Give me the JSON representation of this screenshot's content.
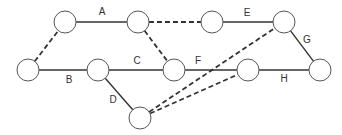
{
  "diagram": {
    "type": "network",
    "nodes": [
      {
        "id": "n1",
        "x": 28,
        "y": 70
      },
      {
        "id": "n2",
        "x": 65,
        "y": 22
      },
      {
        "id": "n3",
        "x": 138,
        "y": 22
      },
      {
        "id": "n4",
        "x": 212,
        "y": 22
      },
      {
        "id": "n5",
        "x": 284,
        "y": 22
      },
      {
        "id": "n6",
        "x": 98,
        "y": 70
      },
      {
        "id": "n7",
        "x": 174,
        "y": 70
      },
      {
        "id": "n8",
        "x": 248,
        "y": 70
      },
      {
        "id": "n9",
        "x": 320,
        "y": 70
      },
      {
        "id": "n10",
        "x": 140,
        "y": 118
      }
    ],
    "edges": [
      {
        "from": "n2",
        "to": "n3",
        "label": "A",
        "dashed": false,
        "lx": 102,
        "ly": 15
      },
      {
        "from": "n1",
        "to": "n6",
        "label": "B",
        "dashed": false,
        "lx": 69,
        "ly": 83
      },
      {
        "from": "n6",
        "to": "n7",
        "label": "C",
        "dashed": false,
        "lx": 137,
        "ly": 64
      },
      {
        "from": "n6",
        "to": "n10",
        "label": "D",
        "dashed": false,
        "lx": 113,
        "ly": 103
      },
      {
        "from": "n4",
        "to": "n5",
        "label": "E",
        "dashed": false,
        "lx": 247,
        "ly": 16
      },
      {
        "from": "n7",
        "to": "n8",
        "label": "F",
        "dashed": false,
        "lx": 198,
        "ly": 64
      },
      {
        "from": "n5",
        "to": "n9",
        "label": "G",
        "dashed": false,
        "lx": 307,
        "ly": 43
      },
      {
        "from": "n8",
        "to": "n9",
        "label": "H",
        "dashed": false,
        "lx": 284,
        "ly": 82
      },
      {
        "from": "n1",
        "to": "n2",
        "label": "",
        "dashed": true
      },
      {
        "from": "n3",
        "to": "n4",
        "label": "",
        "dashed": true
      },
      {
        "from": "n3",
        "to": "n7",
        "label": "",
        "dashed": true
      },
      {
        "from": "n10",
        "to": "n5",
        "label": "",
        "dashed": true
      },
      {
        "from": "n10",
        "to": "n8",
        "label": "",
        "dashed": true
      }
    ],
    "node_radius": 11,
    "stroke_color": "#333333"
  }
}
